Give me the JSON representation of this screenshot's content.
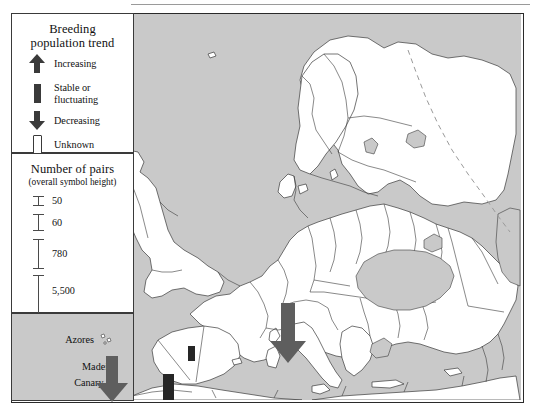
{
  "figure": {
    "kind": "distribution-map",
    "region": "Europe, North Africa and Middle East",
    "land_color": "#ffffff",
    "sea_color": "#c9c9c9",
    "border_color": "#3a3a3a",
    "symbol_color_decreasing": "#5e5e5e",
    "symbol_color_stable": "#262626"
  },
  "legend_trend": {
    "title_line1": "Breeding",
    "title_line2": "population trend",
    "items": [
      {
        "symbol": "up-arrow-icon",
        "label": "Increasing"
      },
      {
        "symbol": "bar-icon",
        "label": "Stable or",
        "label2": "fluctuating"
      },
      {
        "symbol": "down-arrow-icon",
        "label": "Decreasing"
      },
      {
        "symbol": "empty-rectangle-icon",
        "label": "Unknown"
      }
    ]
  },
  "legend_pairs": {
    "title": "Number of pairs",
    "subtitle": "(overall symbol height)",
    "steps": [
      {
        "value": "50",
        "height_px": 10
      },
      {
        "value": "60",
        "height_px": 17
      },
      {
        "value": "780",
        "height_px": 30
      },
      {
        "value": "5,500",
        "height_px": 54
      }
    ]
  },
  "legend_islands": {
    "labels": [
      "Azores",
      "Madeira",
      "Canary Is."
    ]
  },
  "map_symbols": [
    {
      "name": "symbol-italy",
      "type": "down-arrow-icon",
      "trend": "Decreasing"
    },
    {
      "name": "symbol-canary",
      "type": "down-arrow-icon",
      "trend": "Decreasing"
    },
    {
      "name": "symbol-spain-central",
      "type": "bar-icon",
      "trend": "Stable or fluctuating"
    },
    {
      "name": "symbol-gibraltar",
      "type": "bar-icon",
      "trend": "Stable or fluctuating"
    }
  ]
}
